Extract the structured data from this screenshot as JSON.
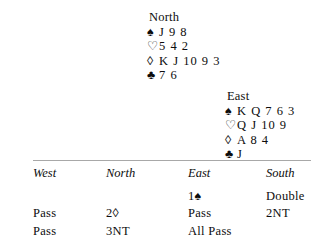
{
  "hands": [
    {
      "position_label": "North",
      "suits": [
        {
          "symbol": "♠",
          "name": "spade-symbol",
          "filled": true,
          "cards": "J 9 8"
        },
        {
          "symbol": "♡",
          "name": "heart-symbol",
          "filled": false,
          "cards": "5 4 2"
        },
        {
          "symbol": "◊",
          "name": "diamond-symbol",
          "filled": false,
          "cards": "K J 10 9 3"
        },
        {
          "symbol": "♣",
          "name": "club-symbol",
          "filled": true,
          "cards": "7 6"
        }
      ]
    },
    {
      "position_label": "East",
      "suits": [
        {
          "symbol": "♠",
          "name": "spade-symbol",
          "filled": true,
          "cards": "K Q 7 6 3"
        },
        {
          "symbol": "♡",
          "name": "heart-symbol",
          "filled": false,
          "cards": "Q J 10 9"
        },
        {
          "symbol": "◊",
          "name": "diamond-symbol",
          "filled": false,
          "cards": "A 8 4"
        },
        {
          "symbol": "♣",
          "name": "club-symbol",
          "filled": true,
          "cards": "J"
        }
      ]
    }
  ],
  "auction": {
    "headers": [
      "West",
      "North",
      "East",
      "South"
    ],
    "rows": [
      [
        "",
        "",
        "1♠",
        "Double"
      ],
      [
        "Pass",
        "2◊",
        "Pass",
        "2NT"
      ],
      [
        "Pass",
        "3NT",
        "All Pass",
        ""
      ]
    ]
  }
}
